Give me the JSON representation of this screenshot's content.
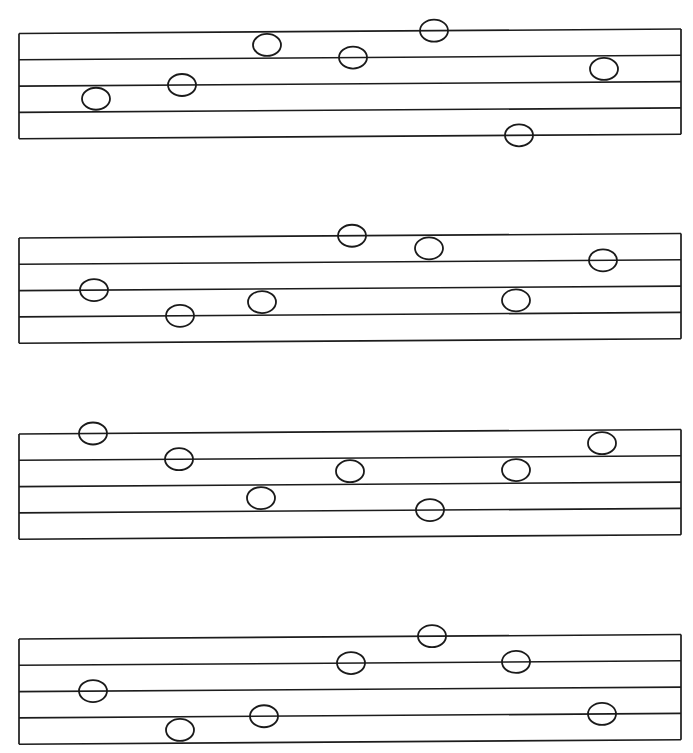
{
  "page": {
    "background_color": "#ffffff",
    "ink_color": "#1c1c1c",
    "width": 693,
    "height": 753,
    "clipped_header_fragment": "|"
  },
  "notation": {
    "notehead_style": "open-oval",
    "notehead_rx": 14,
    "notehead_ry": 11,
    "staff_count": 4,
    "lines_per_staff": 5,
    "staff_left_x": 19,
    "staff_right_x": 681,
    "line_gap": 26.3,
    "skew_rise_px": -4
  },
  "staves": [
    {
      "index": 1,
      "name": "staff-1",
      "top_line_y_left": 33.5,
      "top_line_y_right": 29.0,
      "notes": [
        {
          "id": "s1n1",
          "x": 96,
          "step": 6,
          "label": "note-1"
        },
        {
          "id": "s1n2",
          "x": 182,
          "step": 7,
          "label": "note-2"
        },
        {
          "id": "s1n3",
          "x": 267,
          "step": 10,
          "label": "note-3"
        },
        {
          "id": "s1n4",
          "x": 353,
          "step": 9,
          "label": "note-4"
        },
        {
          "id": "s1n5",
          "x": 434,
          "step": 11,
          "label": "note-5"
        },
        {
          "id": "s1n6",
          "x": 519,
          "step": 3,
          "label": "note-6"
        },
        {
          "id": "s1n7",
          "x": 604,
          "step": 8,
          "label": "note-7"
        }
      ]
    },
    {
      "index": 2,
      "name": "staff-2",
      "top_line_y_left": 238.0,
      "top_line_y_right": 233.5,
      "notes": [
        {
          "id": "s2n1",
          "x": 94,
          "step": 7,
          "label": "note-1"
        },
        {
          "id": "s2n2",
          "x": 180,
          "step": 5,
          "label": "note-2"
        },
        {
          "id": "s2n3",
          "x": 262,
          "step": 6,
          "label": "note-3"
        },
        {
          "id": "s2n4",
          "x": 352,
          "step": 11,
          "label": "note-4"
        },
        {
          "id": "s2n5",
          "x": 429,
          "step": 10,
          "label": "note-5"
        },
        {
          "id": "s2n6",
          "x": 516,
          "step": 6,
          "label": "note-6"
        },
        {
          "id": "s2n7",
          "x": 603,
          "step": 9,
          "label": "note-7"
        }
      ]
    },
    {
      "index": 3,
      "name": "staff-3",
      "top_line_y_left": 434.0,
      "top_line_y_right": 429.5,
      "notes": [
        {
          "id": "s3n1",
          "x": 93,
          "step": 11,
          "label": "note-1"
        },
        {
          "id": "s3n2",
          "x": 179,
          "step": 9,
          "label": "note-2"
        },
        {
          "id": "s3n3",
          "x": 350,
          "step": 8,
          "label": "note-3"
        },
        {
          "id": "s3n4",
          "x": 261,
          "step": 6,
          "label": "note-4"
        },
        {
          "id": "s3n5",
          "x": 430,
          "step": 5,
          "label": "note-5"
        },
        {
          "id": "s3n6",
          "x": 516,
          "step": 8,
          "label": "note-6"
        },
        {
          "id": "s3n7",
          "x": 602,
          "step": 10,
          "label": "note-7"
        }
      ]
    },
    {
      "index": 4,
      "name": "staff-4",
      "top_line_y_left": 639.0,
      "top_line_y_right": 634.5,
      "notes": [
        {
          "id": "s4n1",
          "x": 93,
          "step": 7,
          "label": "note-1"
        },
        {
          "id": "s4n2",
          "x": 180,
          "step": 4,
          "label": "note-2"
        },
        {
          "id": "s4n3",
          "x": 264,
          "step": 5,
          "label": "note-3"
        },
        {
          "id": "s4n4",
          "x": 351,
          "step": 9,
          "label": "note-4"
        },
        {
          "id": "s4n5",
          "x": 432,
          "step": 11,
          "label": "note-5"
        },
        {
          "id": "s4n6",
          "x": 516,
          "step": 9,
          "label": "note-6"
        },
        {
          "id": "s4n7",
          "x": 602,
          "step": 5,
          "label": "note-7"
        }
      ]
    }
  ]
}
